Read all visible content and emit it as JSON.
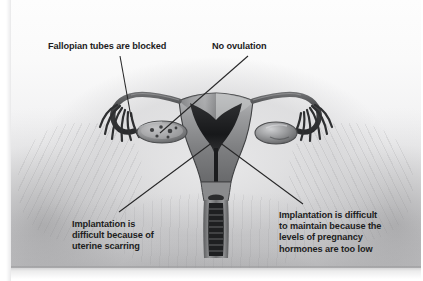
{
  "figure": {
    "kind": "medical-illustration",
    "view": "anterior coronal cutaway",
    "palette": {
      "background": "#ffffff",
      "plate_light": "#fdfdfd",
      "plate_mid": "#e3e3e4",
      "plate_dark": "#c9c9cb",
      "organ_fill": "#8f9092",
      "organ_shadow": "#4a4b4d",
      "organ_highlight": "#d8d8da",
      "leader_line": "#2b2b2b",
      "text": "#1d1d1d"
    }
  },
  "labels": {
    "fallopian": {
      "text": "Fallopian tubes are blocked",
      "points_to": "left fallopian tube fimbriae"
    },
    "ovulation": {
      "text": "No ovulation",
      "points_to": "left ovary"
    },
    "scarring": {
      "text": "Implantation is\ndifficult because of\nuterine scarring",
      "points_to": "uterine endometrial cavity"
    },
    "hormones": {
      "text": "Implantation is difficult\nto maintain because the\nlevels of pregnancy\nhormones are too low",
      "points_to": "uterine endometrial cavity"
    }
  },
  "anatomy": {
    "parts": [
      "uterus-body",
      "endometrial-cavity",
      "cervix",
      "vaginal-canal",
      "left-fallopian-tube",
      "right-fallopian-tube",
      "left-fimbriae",
      "right-fimbriae",
      "left-ovary",
      "right-ovary"
    ]
  }
}
